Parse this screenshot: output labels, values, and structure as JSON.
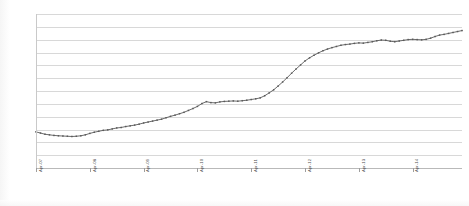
{
  "chart_data": {
    "type": "line",
    "title": "",
    "subtitle": "",
    "xlabel": "",
    "ylabel": "Platelets issued per month",
    "grid": true,
    "legend": false,
    "legend_position": "none",
    "series_color": "#5a5a5a",
    "gridline_color": "#d8d8d8",
    "axis_color": "#b9b9b9",
    "marker": "square",
    "y_tick_labels": [],
    "ylim": [
      0,
      13
    ],
    "gridline_count": 13,
    "x_tick_labels": [
      "Apr-07",
      "Apr-08",
      "Apr-09",
      "Apr-10",
      "Apr-11",
      "Apr-12",
      "Apr-13",
      "Apr-14"
    ],
    "x_tick_index": [
      0,
      12,
      24,
      36,
      48,
      60,
      72,
      84
    ],
    "x": [
      "Apr-07",
      "May-07",
      "Jun-07",
      "Jul-07",
      "Aug-07",
      "Sep-07",
      "Oct-07",
      "Nov-07",
      "Dec-07",
      "Jan-08",
      "Feb-08",
      "Mar-08",
      "Apr-08",
      "May-08",
      "Jun-08",
      "Jul-08",
      "Aug-08",
      "Sep-08",
      "Oct-08",
      "Nov-08",
      "Dec-08",
      "Jan-09",
      "Feb-09",
      "Mar-09",
      "Apr-09",
      "May-09",
      "Jun-09",
      "Jul-09",
      "Aug-09",
      "Sep-09",
      "Oct-09",
      "Nov-09",
      "Dec-09",
      "Jan-10",
      "Feb-10",
      "Mar-10",
      "Apr-10",
      "May-10",
      "Jun-10",
      "Jul-10",
      "Aug-10",
      "Sep-10",
      "Oct-10",
      "Nov-10",
      "Dec-10",
      "Jan-11",
      "Feb-11",
      "Mar-11",
      "Apr-11",
      "May-11",
      "Jun-11",
      "Jul-11",
      "Aug-11",
      "Sep-11",
      "Oct-11",
      "Nov-11",
      "Dec-11",
      "Jan-12",
      "Feb-12",
      "Mar-12",
      "Apr-12",
      "May-12",
      "Jun-12",
      "Jul-12",
      "Aug-12",
      "Sep-12",
      "Oct-12",
      "Nov-12",
      "Dec-12",
      "Jan-13",
      "Feb-13",
      "Mar-13",
      "Apr-13",
      "May-13",
      "Jun-13",
      "Jul-13",
      "Aug-13",
      "Sep-13",
      "Oct-13",
      "Nov-13",
      "Dec-13",
      "Jan-14",
      "Feb-14",
      "Mar-14",
      "Apr-14",
      "May-14",
      "Jun-14",
      "Jul-14",
      "Aug-14",
      "Sep-14",
      "Oct-14",
      "Nov-14",
      "Dec-14",
      "Jan-15",
      "Feb-15",
      "Mar-15"
    ],
    "values": [
      3.05,
      2.95,
      2.85,
      2.8,
      2.75,
      2.72,
      2.7,
      2.68,
      2.66,
      2.68,
      2.72,
      2.8,
      2.92,
      3.02,
      3.1,
      3.18,
      3.22,
      3.3,
      3.38,
      3.42,
      3.5,
      3.56,
      3.62,
      3.7,
      3.8,
      3.88,
      3.96,
      4.04,
      4.12,
      4.24,
      4.36,
      4.46,
      4.58,
      4.7,
      4.86,
      5.02,
      5.2,
      5.44,
      5.6,
      5.52,
      5.5,
      5.58,
      5.62,
      5.64,
      5.66,
      5.64,
      5.68,
      5.72,
      5.78,
      5.84,
      5.92,
      6.1,
      6.34,
      6.6,
      6.92,
      7.26,
      7.62,
      8.0,
      8.36,
      8.7,
      9.04,
      9.3,
      9.52,
      9.72,
      9.9,
      10.04,
      10.16,
      10.26,
      10.36,
      10.42,
      10.46,
      10.52,
      10.56,
      10.54,
      10.6,
      10.66,
      10.74,
      10.8,
      10.78,
      10.7,
      10.66,
      10.72,
      10.78,
      10.84,
      10.86,
      10.84,
      10.82,
      10.86,
      10.96,
      11.1,
      11.22,
      11.28,
      11.36,
      11.44,
      11.52,
      11.6
    ]
  }
}
